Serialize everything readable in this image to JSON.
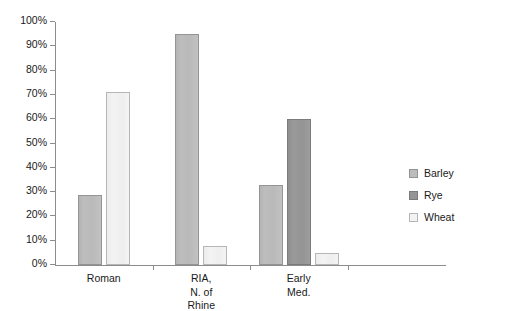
{
  "chart_data": {
    "type": "bar",
    "title": "",
    "subtitle": "",
    "xlabel": "",
    "ylabel": "",
    "ylim": [
      0,
      100
    ],
    "y_unit": "%",
    "grid": false,
    "legend_position": "right",
    "categories": [
      "Roman",
      "RIA,\nN. of\nRhine",
      "Early\nMed.",
      ""
    ],
    "y_ticks": [
      "0%",
      "10%",
      "20%",
      "30%",
      "40%",
      "50%",
      "60%",
      "70%",
      "80%",
      "90%",
      "100%"
    ],
    "y_tick_values": [
      0,
      10,
      20,
      30,
      40,
      50,
      60,
      70,
      80,
      90,
      100
    ],
    "series": [
      {
        "name": "Barley",
        "color": "#bcbcbc",
        "values": [
          29,
          95,
          33,
          null
        ]
      },
      {
        "name": "Rye",
        "color": "#959595",
        "values": [
          null,
          null,
          60,
          null
        ]
      },
      {
        "name": "Wheat",
        "color": "#f2f2f2",
        "values": [
          71,
          8,
          5,
          null
        ]
      }
    ]
  },
  "legend": {
    "items": [
      {
        "label": "Barley",
        "swatch": "barley"
      },
      {
        "label": "Rye",
        "swatch": "rye"
      },
      {
        "label": "Wheat",
        "swatch": "wheat"
      }
    ]
  }
}
